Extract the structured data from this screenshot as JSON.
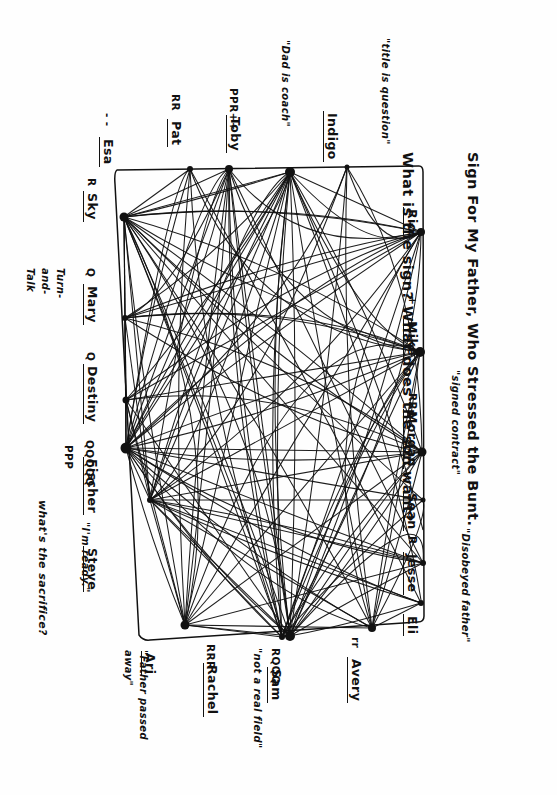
{
  "page": {
    "kind": "hand-drawn-sociogram",
    "ink_color": "#111111",
    "paper_color": "#fefefe"
  },
  "title": {
    "line1": "Sign For My Father, Who Stressed the Bunt.",
    "line2": "What is the sign? What does the son want?"
  },
  "free_notes": {
    "title_is_question": "\"title is question\"",
    "dad_is_coach": "\"Dad is coach\"",
    "signed_contract": "\"signed contract\"",
    "disobeyed_father": "\"Disobeyed father\"",
    "turn_and_talk": "Turn-\nand-\nTalk",
    "whats_the_sacrifice": "what's the sacrifice?",
    "im_ready": "\"I'm ready.\"",
    "father_passed_away": "\"Father passed\naway\"",
    "not_a_real_field": "\"not a real field\""
  },
  "nodes": {
    "top": [
      {
        "name": "Esa",
        "tags": "- -",
        "note": ""
      },
      {
        "name": "Pat",
        "tags": "RR",
        "note": ""
      },
      {
        "name": "Toby",
        "tags": "PPR++",
        "note": "\"Dad is coach\""
      },
      {
        "name": "Indigo",
        "tags": "",
        "note": "\"title is question\""
      }
    ],
    "right": [
      {
        "name": "Rio",
        "tags": "",
        "note": ""
      },
      {
        "name": "Mike",
        "tags": "+",
        "note": ""
      },
      {
        "name": "Morgan",
        "tags": "RR+",
        "note": "\"signed contract\""
      },
      {
        "name": "Sean",
        "tags": "",
        "note": ""
      },
      {
        "name": "Jesse",
        "tags": "R",
        "note": ""
      },
      {
        "name": "Eli",
        "tags": "",
        "note": "\"Disobeyed father\""
      }
    ],
    "bottom": [
      {
        "name": "Avery",
        "tags": "rr",
        "note": ""
      },
      {
        "name": "Sam",
        "tags": "RQQQ",
        "note": "\"not a real field\""
      },
      {
        "name": "Rachel",
        "tags": "RRR",
        "note": ""
      },
      {
        "name": "Ari",
        "tags": "",
        "note": "\"Father passed away\""
      }
    ],
    "left": [
      {
        "name": "Sky",
        "tags": "R",
        "note": ""
      },
      {
        "name": "Mary",
        "tags": "Q",
        "note": "Turn-and-Talk"
      },
      {
        "name": "Destiny",
        "tags": "Q",
        "note": ""
      },
      {
        "name": "Fischer",
        "tags": "QQQQQ",
        "note": "PPP"
      },
      {
        "name": "Steve",
        "tags": "",
        "note": "\"I'm ready.\""
      }
    ]
  },
  "legend_marks": {
    "R": "response",
    "Q": "question",
    "P": "prompt",
    "plus": "+",
    "dash": "-"
  }
}
